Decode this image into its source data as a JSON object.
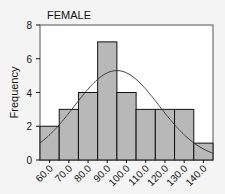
{
  "chart_data": {
    "type": "bar",
    "title": "FEMALE",
    "xlabel": "",
    "ylabel": "Frequency",
    "categories": [
      "60.0",
      "70.0",
      "80.0",
      "90.0",
      "100.0",
      "110.0",
      "120.0",
      "130.0",
      "140.0"
    ],
    "values": [
      2,
      3,
      4,
      7,
      4,
      3,
      3,
      3,
      1
    ],
    "ylim": [
      0,
      8
    ],
    "yticks": [
      0,
      2,
      4,
      6,
      8
    ],
    "grid": false,
    "overlay": "normal curve",
    "normal_curve_peak": {
      "x": "95.0",
      "y": 5.3
    },
    "colors": {
      "bar_fill": "#b8b8b8",
      "bar_edge": "#111111",
      "background": "#f4f4f4",
      "plot_bg": "#ffffff"
    }
  }
}
